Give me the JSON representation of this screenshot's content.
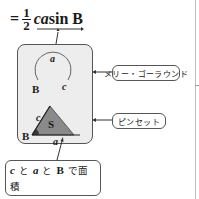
{
  "formula": {
    "equals": "=",
    "numerator": "1",
    "denominator": "2",
    "variables": "ca",
    "function": "sin B"
  },
  "diagram": {
    "merry_go_round": {
      "label_arc": "a",
      "label_vertex": "B",
      "label_side": "c"
    },
    "tweezers": {
      "label_side_c": "c",
      "label_area": "S",
      "label_vertex": "B",
      "label_side_a": "a"
    },
    "colors": {
      "box_fill": "#ededed",
      "triangle_fill": "#8a8a8a",
      "angle_fill": "#3a3a3a",
      "border": "#555555"
    }
  },
  "callouts": {
    "merry_go_round": "メリー・ゴーラウンド",
    "tweezers": "ピンセット"
  },
  "note": {
    "c": "c",
    "to1": "と",
    "a": "a",
    "to2": "と",
    "B": "B",
    "de_menseki": "で面積",
    "S": "S",
    "wo_hasamu": "をはさむ。"
  }
}
